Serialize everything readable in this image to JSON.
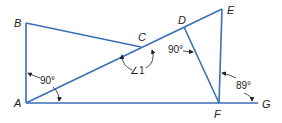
{
  "diagram": {
    "type": "geometry",
    "line_color": "#3b6fb6",
    "points": {
      "A": {
        "label": "A",
        "x": 26,
        "y": 103
      },
      "B": {
        "label": "B",
        "x": 26,
        "y": 23
      },
      "C": {
        "label": "C",
        "x": 141,
        "y": 47
      },
      "D": {
        "label": "D",
        "x": 184,
        "y": 27
      },
      "E": {
        "label": "E",
        "x": 222,
        "y": 9
      },
      "F": {
        "label": "F",
        "x": 219,
        "y": 103
      },
      "G": {
        "label": "G",
        "x": 258,
        "y": 103
      }
    },
    "segments": [
      "AB",
      "BC",
      "AE",
      "AG",
      "DF",
      "EF"
    ],
    "angles": [
      {
        "id": "angle-BAF",
        "label": "90°"
      },
      {
        "id": "angle-1",
        "label": "∠1"
      },
      {
        "id": "angle-CDF",
        "label": "90°"
      },
      {
        "id": "angle-EFG",
        "label": "89°"
      }
    ]
  }
}
